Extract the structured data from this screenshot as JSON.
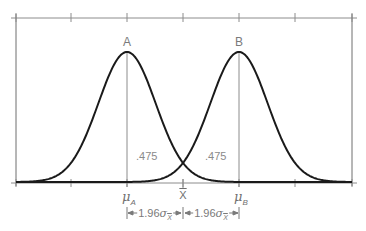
{
  "figure": {
    "type": "two-normal-distributions-hypothesis-test",
    "peak_labels": {
      "a": "A",
      "b": "B"
    },
    "area_labels": {
      "left": ".475",
      "right": ".475"
    },
    "axis_labels": {
      "mu_a_symbol": "μ",
      "mu_a_sub": "A",
      "xbar_symbol": "X",
      "mu_b_symbol": "μ",
      "mu_b_sub": "B"
    },
    "dimension_labels": {
      "left_coef": "1.96",
      "left_sigma": "σ",
      "left_sub": "X",
      "right_coef": "1.96",
      "right_sigma": "σ",
      "right_sub": "X"
    },
    "colors": {
      "curve": "#1a1a1a",
      "frame": "#8c8c8c",
      "text": "#7a7a7a"
    }
  },
  "chart_data": {
    "type": "line",
    "title": "",
    "xlabel": "",
    "ylabel": "",
    "series": [
      {
        "name": "A",
        "distribution": "normal",
        "mean_label": "μA",
        "mean_px": 127,
        "sigma_px": 28.6
      },
      {
        "name": "B",
        "distribution": "normal",
        "mean_label": "μB",
        "mean_px": 239,
        "sigma_px": 28.6
      }
    ],
    "annotations": [
      {
        "text": ".475",
        "region": "between μA and X̄ under curve A"
      },
      {
        "text": ".475",
        "region": "between X̄ and μB under curve B"
      },
      {
        "text": "1.96σX̄",
        "span": "μA to X̄"
      },
      {
        "text": "1.96σX̄",
        "span": "X̄ to μB"
      }
    ],
    "x_ticks_px": [
      16,
      71,
      127,
      183,
      239,
      295,
      352
    ],
    "x_tick_labels": [
      "",
      "",
      "μA",
      "X̄",
      "μB",
      "",
      ""
    ],
    "grid": false,
    "legend": "none"
  }
}
